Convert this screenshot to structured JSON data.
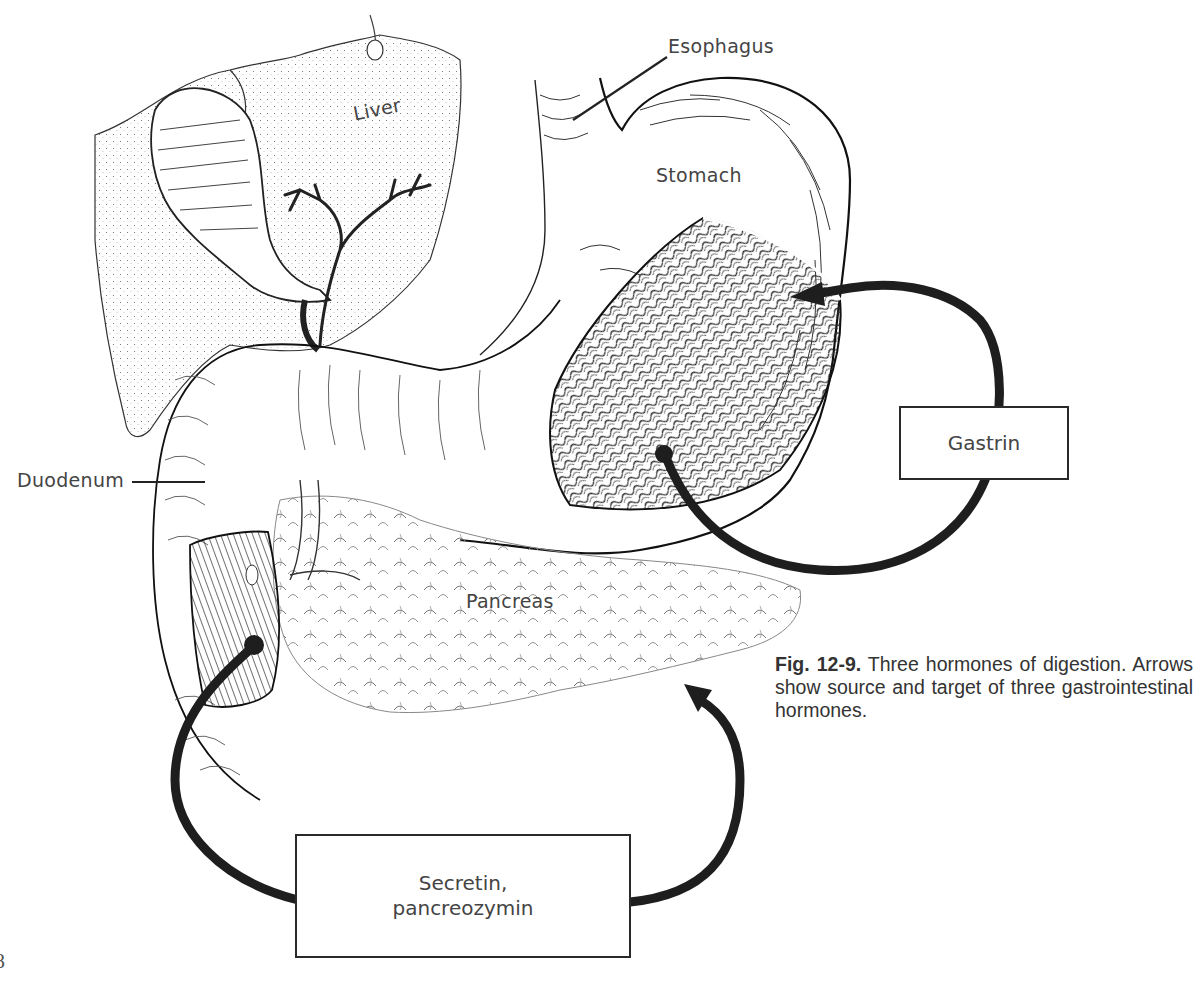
{
  "figure": {
    "number": "Fig. 12-9.",
    "caption_text": "Three hormones of digestion. Arrows show source and target of three gastrointestinal hormones.",
    "page_number_partial": "8"
  },
  "anatomy_labels": {
    "esophagus": "Esophagus",
    "liver": "Liver",
    "stomach": "Stomach",
    "duodenum": "Duodenum",
    "pancreas": "Pancreas"
  },
  "hormone_boxes": {
    "gastrin": "Gastrin",
    "secretin_line1": "Secretin,",
    "secretin_line2": "pancreozymin"
  },
  "arrows": [
    {
      "hormone": "Gastrin",
      "source": "stomach lining (antrum)",
      "target": "stomach upper body"
    },
    {
      "hormone": "Secretin, pancreozymin",
      "source": "duodenum lining",
      "target": "pancreas"
    }
  ],
  "colors": {
    "ink": "#1e1e1e",
    "paper": "#ffffff",
    "stipple": "#555555",
    "label_text": "#444444"
  }
}
